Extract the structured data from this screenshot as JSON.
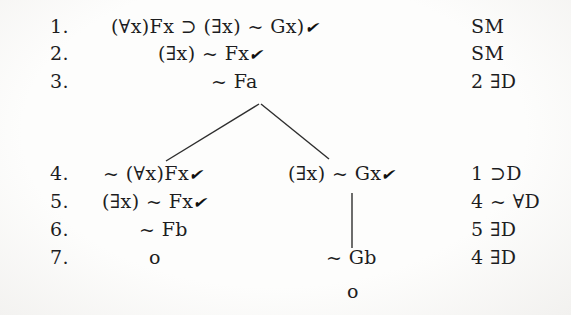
{
  "colors": {
    "background": "#fdfdfc",
    "ink": "#1d1d1f"
  },
  "icons": {
    "check": "✔"
  },
  "tree": {
    "rows": [
      {
        "num": "1.",
        "formula": "(∀x)Fx ⊃ (∃x) ~ Gx)",
        "checked": true,
        "just": "SM"
      },
      {
        "num": "2.",
        "formula": "(∃x) ~ Fx",
        "checked": true,
        "just": "SM"
      },
      {
        "num": "3.",
        "formula": "~ Fa",
        "checked": false,
        "just": "2 ∃D"
      },
      {
        "num": "4.",
        "formula_left": "~ (∀x)Fx",
        "formula_right": "(∃x) ~ Gx",
        "checked_left": true,
        "checked_right": true,
        "just": "1 ⊃D"
      },
      {
        "num": "5.",
        "formula": "(∃x) ~ Fx",
        "checked": true,
        "just": "4 ~ ∀D"
      },
      {
        "num": "6.",
        "formula": "~ Fb",
        "checked": false,
        "just": "5 ∃D"
      },
      {
        "num": "7.",
        "formula_left": "o",
        "formula_right": "~ Gb",
        "checked_left": false,
        "checked_right": false,
        "just": "4 ∃D"
      }
    ],
    "right_branch_terminal": "o"
  }
}
